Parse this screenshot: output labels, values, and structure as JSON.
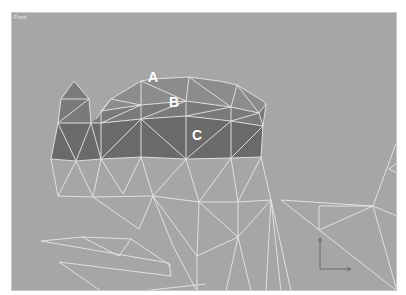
{
  "viewport": {
    "label": "Front",
    "background_color": "#a6a6a6",
    "wire_color": "#e6e6e6",
    "shade_colors": {
      "A": "#8c8c8c",
      "B": "#7a7a7a",
      "C": "#6a6a6a"
    }
  },
  "regions": [
    {
      "id": "A",
      "label": "A"
    },
    {
      "id": "B",
      "label": "B"
    },
    {
      "id": "C",
      "label": "C"
    }
  ],
  "axis_gizmo": {
    "vertical_axis": "z",
    "horizontal_axis": "x"
  }
}
